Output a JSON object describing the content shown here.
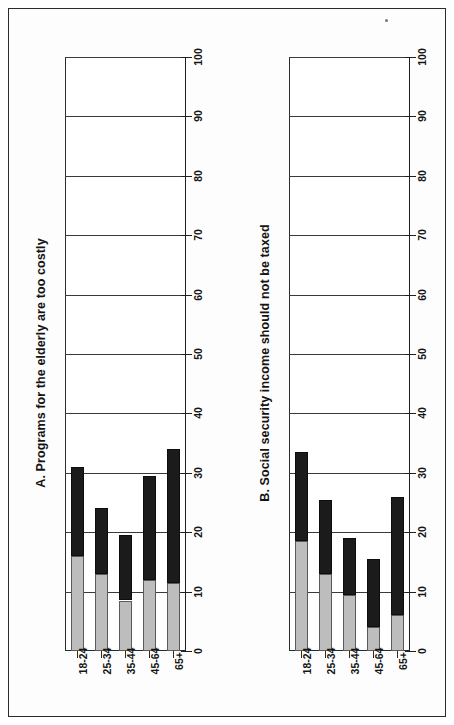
{
  "figure": {
    "panels": [
      {
        "id": "A",
        "title": "A. Programs for the elderly are too costly",
        "categories": [
          "18-24",
          "25-34",
          "35-44",
          "45-64",
          "65+"
        ],
        "series": [
          {
            "name": "lower-segment",
            "color": "#bdbdbd",
            "values": [
              16,
              13,
              8.5,
              12,
              11.5
            ]
          },
          {
            "name": "upper-segment",
            "color": "#1b1b1b",
            "values": [
              15,
              11,
              11,
              17.5,
              22.5
            ]
          }
        ],
        "totals": [
          31,
          24,
          19.5,
          29.5,
          34
        ],
        "ticks": [
          "0",
          "10",
          "20",
          "30",
          "40",
          "50",
          "60",
          "70",
          "80",
          "90",
          "100"
        ]
      },
      {
        "id": "B",
        "title": "B. Social security income should not be taxed",
        "categories": [
          "18-24",
          "25-34",
          "35-44",
          "45-64",
          "65+"
        ],
        "series": [
          {
            "name": "lower-segment",
            "color": "#bdbdbd",
            "values": [
              18.5,
              13,
              9.5,
              4,
              6
            ]
          },
          {
            "name": "upper-segment",
            "color": "#1b1b1b",
            "values": [
              15,
              12.5,
              9.5,
              11.5,
              20
            ]
          }
        ],
        "totals": [
          33.5,
          25.5,
          19,
          15.5,
          26
        ],
        "ticks": [
          "0",
          "10",
          "20",
          "30",
          "40",
          "50",
          "60",
          "70",
          "80",
          "90",
          "100"
        ]
      }
    ]
  },
  "chart_data": [
    {
      "type": "bar",
      "title": "A. Programs for the elderly are too costly",
      "orientation": "vertical-stacked",
      "categories": [
        "18-24",
        "25-34",
        "35-44",
        "45-64",
        "65+"
      ],
      "series": [
        {
          "name": "lower-segment",
          "values": [
            16,
            13,
            8.5,
            12,
            11.5
          ]
        },
        {
          "name": "upper-segment",
          "values": [
            15,
            11,
            11,
            17.5,
            22.5
          ]
        }
      ],
      "stacked_totals": [
        31,
        24,
        19.5,
        29.5,
        34
      ],
      "xlabel": "",
      "ylabel": "",
      "ylim": [
        0,
        100
      ],
      "yticks": [
        0,
        10,
        20,
        30,
        40,
        50,
        60,
        70,
        80,
        90,
        100
      ],
      "grid": true,
      "legend": false
    },
    {
      "type": "bar",
      "title": "B. Social security income should not be taxed",
      "orientation": "vertical-stacked",
      "categories": [
        "18-24",
        "25-34",
        "35-44",
        "45-64",
        "65+"
      ],
      "series": [
        {
          "name": "lower-segment",
          "values": [
            18.5,
            13,
            9.5,
            4,
            6
          ]
        },
        {
          "name": "upper-segment",
          "values": [
            15,
            12.5,
            9.5,
            11.5,
            20
          ]
        }
      ],
      "stacked_totals": [
        33.5,
        25.5,
        19,
        15.5,
        26
      ],
      "xlabel": "",
      "ylabel": "",
      "ylim": [
        0,
        100
      ],
      "yticks": [
        0,
        10,
        20,
        30,
        40,
        50,
        60,
        70,
        80,
        90,
        100
      ],
      "grid": true,
      "legend": false
    }
  ]
}
